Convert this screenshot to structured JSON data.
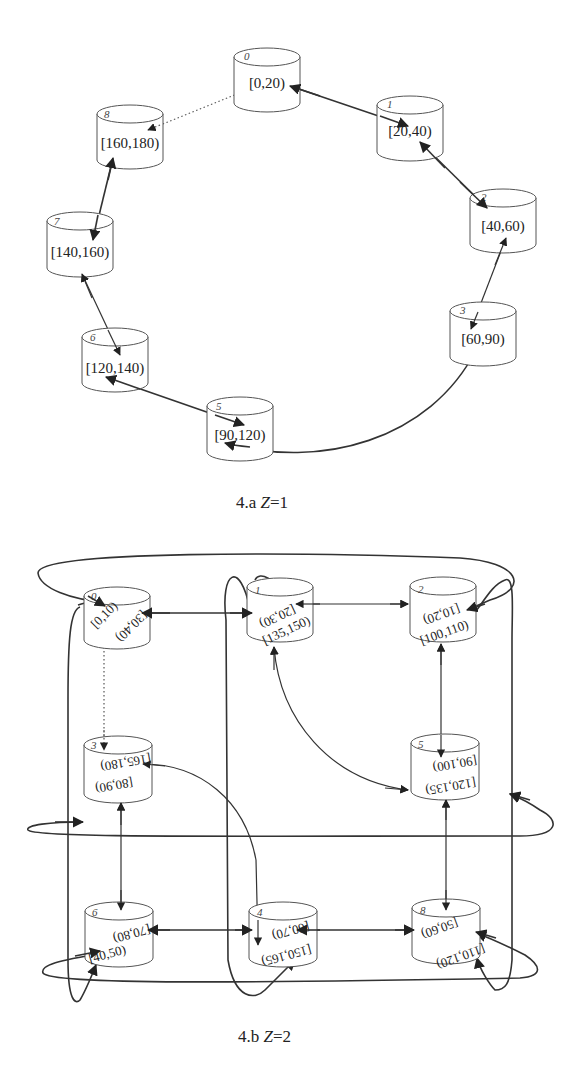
{
  "figure_a": {
    "caption_prefix": "4.a",
    "caption_var": "Z",
    "caption_value": "=1",
    "nodes": [
      {
        "id": "0",
        "label": "[0,20)"
      },
      {
        "id": "1",
        "label": "[20,40)"
      },
      {
        "id": "2",
        "label": "[40,60)"
      },
      {
        "id": "3",
        "label": "[60,90)"
      },
      {
        "id": "5",
        "label": "[90,120)"
      },
      {
        "id": "6",
        "label": "[120,140)"
      },
      {
        "id": "7",
        "label": "[140,160)"
      },
      {
        "id": "8",
        "label": "[160,180)"
      }
    ],
    "edges": [
      {
        "from": "0",
        "to": "1",
        "style": "solid-bidirectional"
      },
      {
        "from": "1",
        "to": "2",
        "style": "solid-bidirectional"
      },
      {
        "from": "2",
        "to": "3",
        "style": "solid-bidirectional"
      },
      {
        "from": "3",
        "to": "5",
        "style": "solid-bidirectional"
      },
      {
        "from": "5",
        "to": "6",
        "style": "solid-bidirectional"
      },
      {
        "from": "6",
        "to": "7",
        "style": "solid-bidirectional"
      },
      {
        "from": "7",
        "to": "8",
        "style": "solid-bidirectional"
      },
      {
        "from": "0",
        "to": "8",
        "style": "dotted"
      }
    ]
  },
  "figure_b": {
    "caption_prefix": "4.b",
    "caption_var": "Z",
    "caption_value": "=2",
    "nodes": [
      {
        "id": "0",
        "labels": [
          "[0,10)",
          "[30,40)"
        ]
      },
      {
        "id": "1",
        "labels": [
          "[20,30)",
          "[135,150)"
        ]
      },
      {
        "id": "2",
        "labels": [
          "[10,20)",
          "[100,110)"
        ]
      },
      {
        "id": "3",
        "labels": [
          "[165,180)",
          "[80,90)"
        ]
      },
      {
        "id": "5",
        "labels": [
          "[90,100)",
          "[120,135)"
        ]
      },
      {
        "id": "6",
        "labels": [
          "[70,80)",
          "[40,50)"
        ]
      },
      {
        "id": "4",
        "labels": [
          "[60,70)",
          "[150,165)"
        ]
      },
      {
        "id": "8",
        "labels": [
          "[50,60)",
          "[110,120)"
        ]
      }
    ]
  }
}
